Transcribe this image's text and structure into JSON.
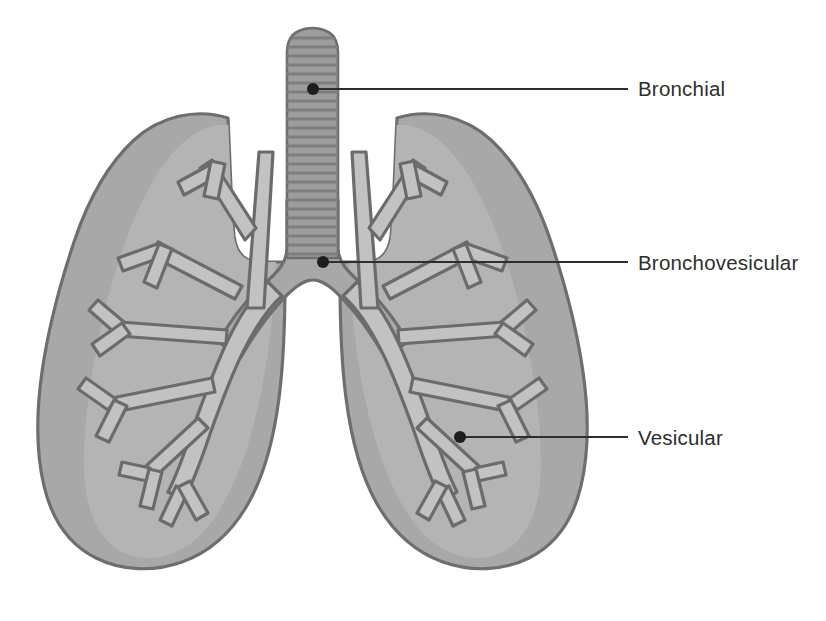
{
  "diagram": {
    "background_color": "#ffffff"
  },
  "colors": {
    "lung_fill": "#a8a8a8",
    "lung_inner_shade": "#b4b4b4",
    "lung_outline": "#6e6e6e",
    "bronchi_fill": "#c4c4c4",
    "bronchi_outline": "#6b6b6b",
    "trachea_fill": "#9d9d9d",
    "trachea_ring": "#7a7a7a",
    "leader_line": "#2e2e2e",
    "marker_dot": "#1d1d1d",
    "label_text": "#2e2e2e"
  },
  "callouts": [
    {
      "id": "bronchial",
      "label": "Bronchial",
      "marker": {
        "x": 313,
        "y": 89
      },
      "line_end": {
        "x": 628,
        "y": 89
      }
    },
    {
      "id": "bronchovesicular",
      "label": "Bronchovesicular",
      "marker": {
        "x": 323,
        "y": 262
      },
      "line_end": {
        "x": 628,
        "y": 262
      }
    },
    {
      "id": "vesicular",
      "label": "Vesicular",
      "marker": {
        "x": 460,
        "y": 437
      },
      "line_end": {
        "x": 628,
        "y": 437
      }
    }
  ],
  "anatomy": {
    "trachea": {
      "name": "trachea",
      "ring_count": 24,
      "top": 28,
      "bottom": 258,
      "left": 285,
      "right": 340
    },
    "left_lung": {
      "name": "left-lung"
    },
    "right_lung": {
      "name": "right-lung"
    },
    "carina": {
      "name": "carina",
      "x": 323,
      "y": 262
    }
  }
}
